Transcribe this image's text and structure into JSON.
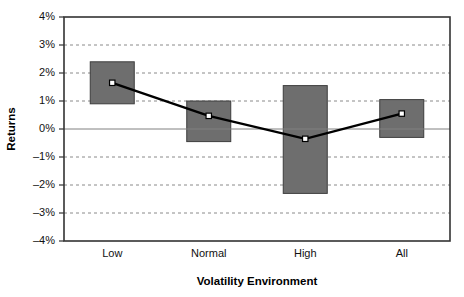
{
  "chart_data": {
    "type": "bar",
    "title": "",
    "subtitle": "",
    "xlabel": "Volatility Environment",
    "ylabel": "Returns",
    "categories": [
      "Low",
      "Normal",
      "High",
      "All"
    ],
    "ylim": [
      -4,
      4
    ],
    "ytick_labels": [
      "4%",
      "3%",
      "2%",
      "1%",
      "0%",
      "–1%",
      "–2%",
      "–3%",
      "–4%"
    ],
    "ytick_values": [
      4,
      3,
      2,
      1,
      0,
      -1,
      -2,
      -3,
      -4
    ],
    "grid": "horizontal-dotted",
    "legend": "none",
    "series": [
      {
        "name": "Range",
        "type": "bar",
        "kind": "floating-range",
        "low": [
          0.9,
          -0.45,
          -2.3,
          -0.3
        ],
        "high": [
          2.4,
          1.0,
          1.55,
          1.05
        ],
        "color": "#6e6e6e",
        "border_color": "#3d3d3d"
      },
      {
        "name": "Mean Returns",
        "type": "line",
        "values": [
          1.65,
          0.47,
          -0.35,
          0.55
        ],
        "color": "#000000",
        "marker": "square",
        "marker_fill": "#ffffff"
      }
    ]
  },
  "axes": {
    "plot_border_color": "#333333",
    "zero_line_color": "#808080",
    "gridline_color": "#8a8a8a",
    "background": "#ffffff"
  }
}
